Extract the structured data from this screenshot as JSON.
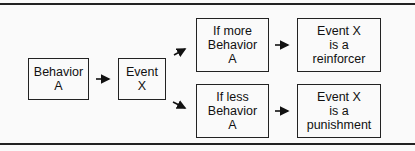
{
  "diagram": {
    "nodes": {
      "behavior_a": {
        "lines": [
          "Behavior",
          "A"
        ]
      },
      "event_x": {
        "lines": [
          "Event",
          "X"
        ]
      },
      "if_more": {
        "lines": [
          "If more",
          "Behavior",
          "A"
        ]
      },
      "if_less": {
        "lines": [
          "If less",
          "Behavior",
          "A"
        ]
      },
      "reinforcer": {
        "lines": [
          "Event X",
          "is a",
          "reinforcer"
        ]
      },
      "punishment": {
        "lines": [
          "Event X",
          "is a",
          "punishment"
        ]
      }
    },
    "edges": [
      {
        "from": "behavior_a",
        "to": "event_x"
      },
      {
        "from": "event_x",
        "to": "if_more"
      },
      {
        "from": "event_x",
        "to": "if_less"
      },
      {
        "from": "if_more",
        "to": "reinforcer"
      },
      {
        "from": "if_less",
        "to": "punishment"
      }
    ]
  }
}
